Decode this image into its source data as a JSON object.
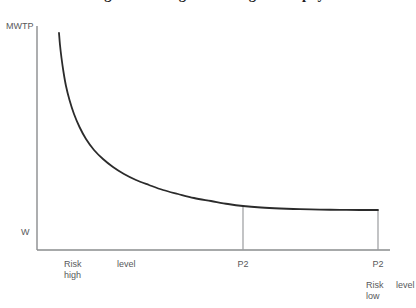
{
  "chart_data": {
    "type": "line",
    "title": "Figure 1. Marginal willingness to pay",
    "title_clipped": true,
    "xlabel": "Risk level",
    "ylabel": "MWTP",
    "grid": false,
    "legend": false,
    "axis_labels": {
      "y_top": "MWTP",
      "y_bottom": "W"
    },
    "x_tick_labels": [
      {
        "id": "risk-high",
        "line1": "Risk",
        "line2": "high",
        "x_px": 70
      },
      {
        "id": "level-left",
        "line1": "level",
        "x_px": 127
      },
      {
        "id": "p2-mid",
        "line1": "P2",
        "x_px": 243
      },
      {
        "id": "p2-right",
        "line1": "P2",
        "x_px": 378
      },
      {
        "id": "risk-low",
        "line1": "Risk",
        "line2": "low",
        "x_px": 378
      },
      {
        "id": "level-right",
        "line1": "level",
        "x_px": 406
      }
    ],
    "series": [
      {
        "name": "Marginal willingness to pay",
        "comment": "Convex decreasing curve (hyperbolic decay) in plot pixel coords",
        "points": [
          [
            59,
            33
          ],
          [
            60,
            45
          ],
          [
            61.5,
            58
          ],
          [
            63.5,
            72
          ],
          [
            66,
            86
          ],
          [
            69.5,
            100
          ],
          [
            74,
            114
          ],
          [
            79.5,
            127
          ],
          [
            86,
            139
          ],
          [
            94,
            150
          ],
          [
            103,
            159
          ],
          [
            113,
            167
          ],
          [
            124,
            174
          ],
          [
            136,
            180
          ],
          [
            149,
            185
          ],
          [
            163,
            190
          ],
          [
            178,
            194
          ],
          [
            194,
            198
          ],
          [
            211,
            201
          ],
          [
            228,
            204
          ],
          [
            243,
            206
          ],
          [
            261,
            207.5
          ],
          [
            280,
            208.5
          ],
          [
            300,
            209.2
          ],
          [
            320,
            209.6
          ],
          [
            340,
            209.9
          ],
          [
            360,
            210
          ],
          [
            378,
            210
          ]
        ]
      }
    ],
    "drop_lines": [
      {
        "id": "drop-p2-mid",
        "x_px": 243,
        "y_top_px": 206,
        "y_bottom_px": 250
      },
      {
        "id": "drop-p2-right",
        "x_px": 378,
        "y_top_px": 210,
        "y_bottom_px": 250
      }
    ],
    "axes_geometry": {
      "y_axis_x_px": 37,
      "y_axis_top_px": 26,
      "x_axis_y_px": 250,
      "x_axis_right_px": 390
    },
    "colors": {
      "curve": "#2b2b2b",
      "axis": "#8a8c8e",
      "dropline": "#9a9c9e",
      "text": "#58595b",
      "title": "#1d1d1d",
      "background": "#ffffff"
    }
  }
}
